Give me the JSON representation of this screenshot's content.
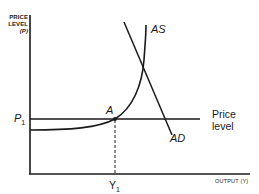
{
  "diagram": {
    "y_axis": {
      "line1": "PRICE",
      "line2": "LEVEL",
      "line3": "(P)"
    },
    "x_axis": {
      "title": "OUTPUT (Y)"
    },
    "labels": {
      "as_curve": "AS",
      "ad_curve": "AD",
      "point_a": "A",
      "p1": "P",
      "p1_sub": "1",
      "y1": "Y",
      "y1_sub": "1",
      "price_level_line1": "Price",
      "price_level_line2": "level"
    },
    "colors": {
      "ink": "#1a1a1a",
      "background": "#ffffff"
    }
  }
}
